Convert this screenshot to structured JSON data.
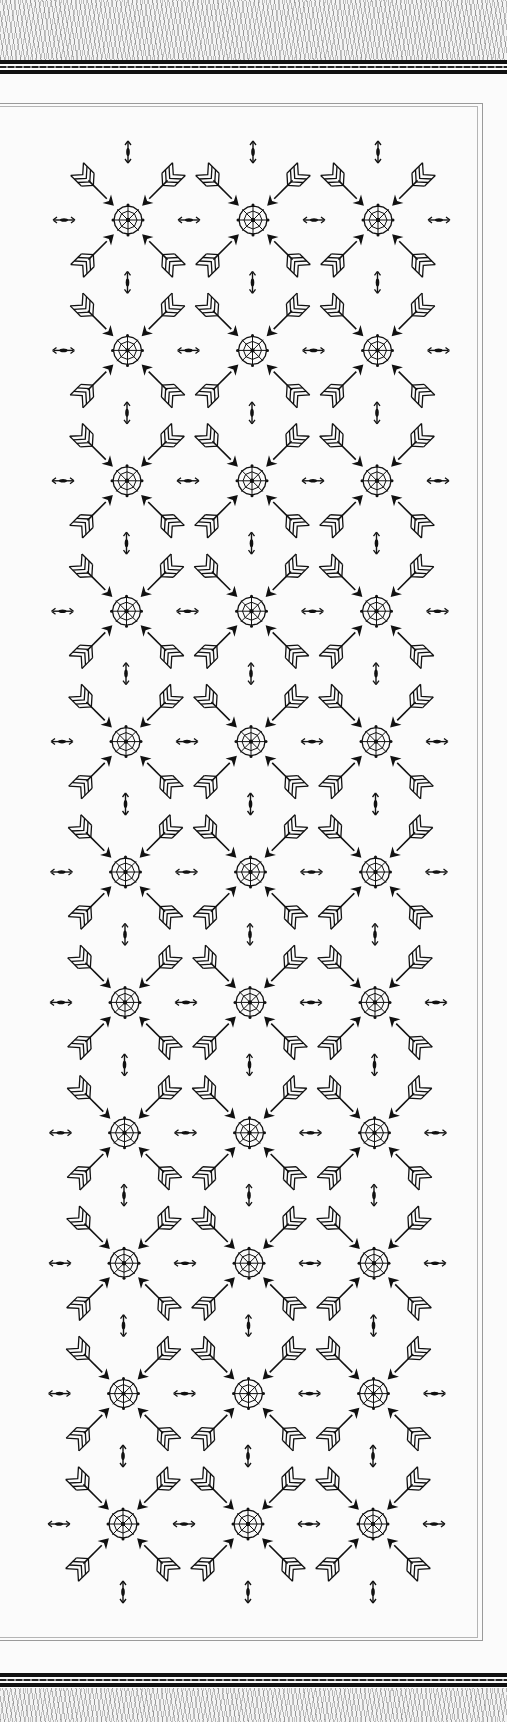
{
  "page": {
    "width": 507,
    "height": 1722,
    "background": "#fbfbfb",
    "ink_color": "#111111",
    "frame_color": "#9a9a9a"
  },
  "pattern": {
    "motif": {
      "center": "compass-rose-web-icon",
      "diagonal_arrows": [
        "arrow-nw-icon",
        "arrow-ne-icon",
        "arrow-sw-icon",
        "arrow-se-icon"
      ],
      "spacers": [
        "double-arrow-vertical-icon",
        "double-arrow-horizontal-icon"
      ]
    },
    "grid": {
      "columns": 3,
      "rows": 11,
      "origin_x": 128,
      "origin_y": 220,
      "step_x": 125,
      "step_y": 130.4,
      "row_drift_x": -0.5
    }
  }
}
